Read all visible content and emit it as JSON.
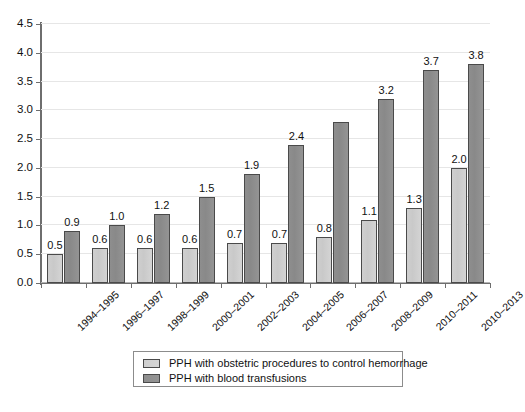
{
  "chart_data": {
    "type": "bar",
    "title": "",
    "subtitle": "",
    "xlabel": "",
    "ylabel": "",
    "ylim": [
      0.0,
      4.5
    ],
    "ytick_step": 0.5,
    "yticks": [
      "0.0",
      "0.5",
      "1.0",
      "1.5",
      "2.0",
      "2.5",
      "3.0",
      "3.5",
      "4.0",
      "4.5"
    ],
    "grid": "horizontal",
    "legend_position": "bottom",
    "categories": [
      "1994–1995",
      "1996–1997",
      "1998–1999",
      "2000–2001",
      "2002–2003",
      "2004–2005",
      "2006–2007",
      "2008–2009",
      "2010–2011",
      "2010–2013"
    ],
    "series": [
      {
        "name": "PPH with obstetric procedures to control hemorrhage",
        "color": "#cfcfcf",
        "values": [
          0.5,
          0.6,
          0.6,
          0.6,
          0.7,
          0.7,
          0.8,
          1.1,
          1.3,
          2.0
        ],
        "labels": [
          "0.5",
          "0.6",
          "0.6",
          "0.6",
          "0.7",
          "0.7",
          "0.8",
          "1.1",
          "1.3",
          "2.0"
        ]
      },
      {
        "name": "PPH with blood transfusions",
        "color": "#8e8e8e",
        "values": [
          0.9,
          1.0,
          1.2,
          1.5,
          1.9,
          2.4,
          2.8,
          3.2,
          3.7,
          3.8
        ],
        "labels": [
          "0.9",
          "1.0",
          "1.2",
          "1.5",
          "1.9",
          "2.4",
          "2.8",
          "3.2",
          "3.7",
          "3.8"
        ]
      }
    ],
    "bar_label_visibility": {
      "series_0": [
        true,
        true,
        true,
        true,
        true,
        true,
        true,
        true,
        true,
        true
      ],
      "series_1": [
        true,
        true,
        true,
        true,
        true,
        true,
        false,
        true,
        true,
        true
      ]
    }
  },
  "legend": {
    "items": [
      {
        "label": "PPH with obstetric procedures to control hemorrhage",
        "swatch": "light-gray"
      },
      {
        "label": "PPH with blood transfusions",
        "swatch": "dark-gray"
      }
    ]
  },
  "footer": {
    "cut_off_text": ""
  }
}
